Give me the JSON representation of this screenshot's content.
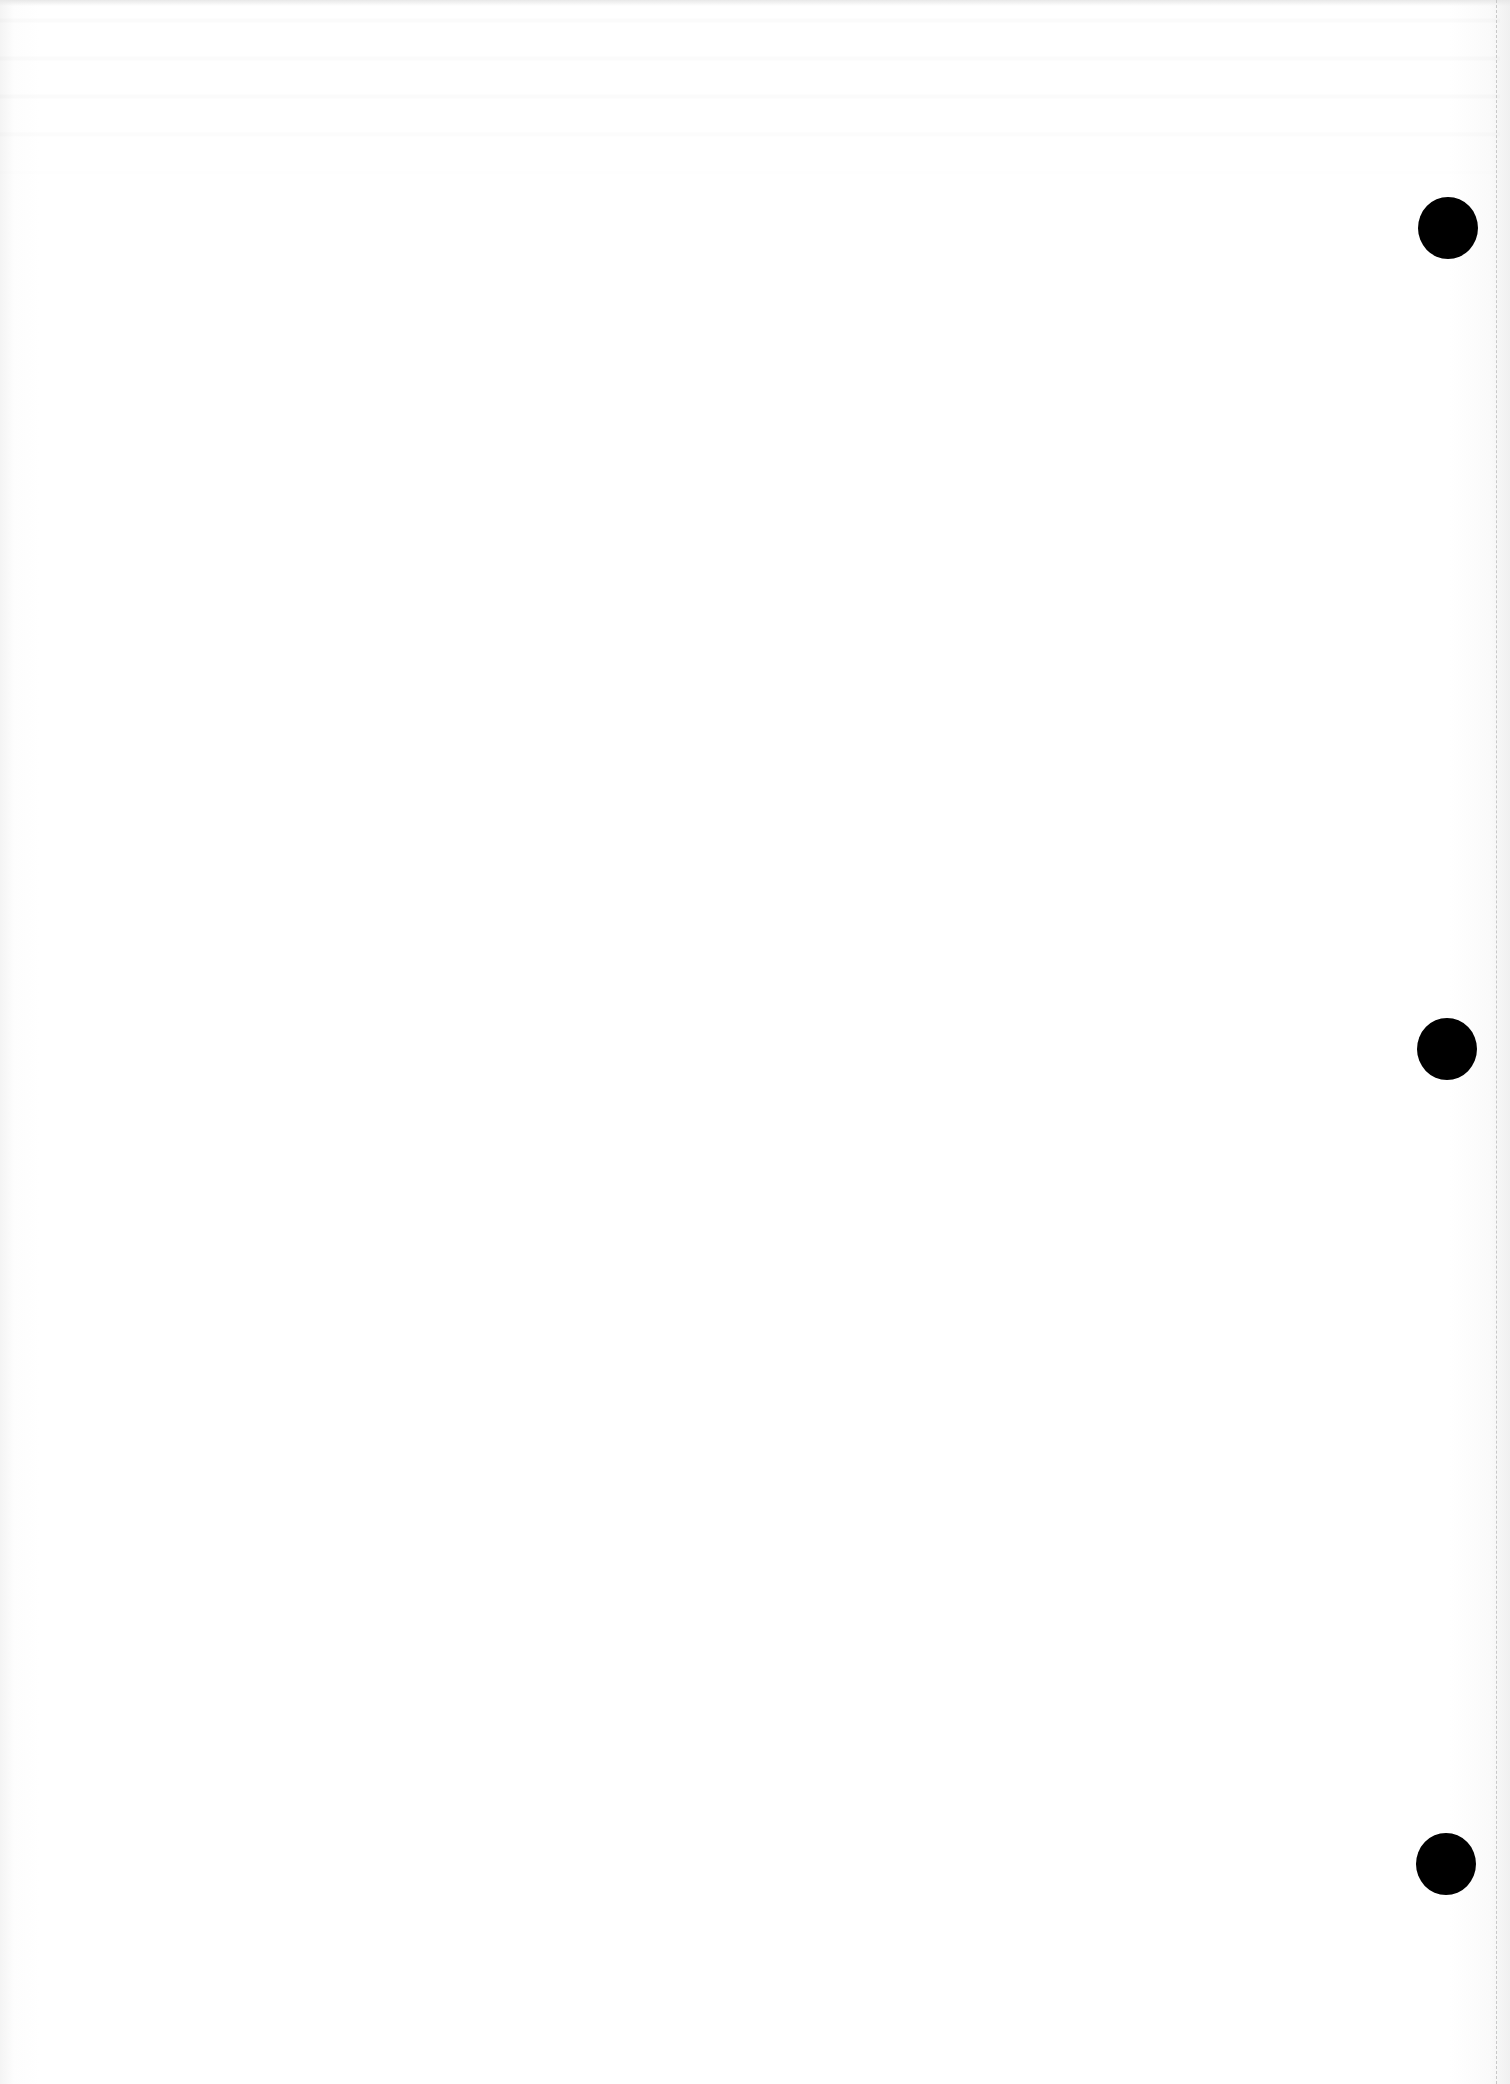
{
  "document": {
    "type": "blank hole-punched sheet",
    "background_color": "#ffffff",
    "text_content": "",
    "punch_holes": [
      {
        "cx": 1448,
        "cy": 228,
        "color": "#000000"
      },
      {
        "cx": 1447,
        "cy": 1049,
        "color": "#000000"
      },
      {
        "cx": 1446,
        "cy": 1864,
        "color": "#000000"
      }
    ],
    "perforation": {
      "x": 1496,
      "style": "dashed",
      "color": "#c8c8c8"
    }
  }
}
